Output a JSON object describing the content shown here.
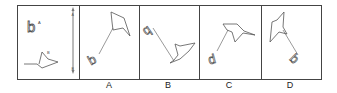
{
  "puzzle": {
    "reference_panel": {
      "label_letter": "b",
      "point_a_label": "A",
      "point_b_label": "B",
      "arrow_top_label": "A",
      "arrow_bottom_label": "B"
    },
    "options": [
      {
        "label": "A",
        "letter": "b"
      },
      {
        "label": "B",
        "letter": "q"
      },
      {
        "label": "C",
        "letter": "d"
      },
      {
        "label": "D",
        "letter": "b"
      }
    ],
    "colors": {
      "stroke": "#555555",
      "border": "#444444",
      "background": "#ffffff"
    }
  }
}
